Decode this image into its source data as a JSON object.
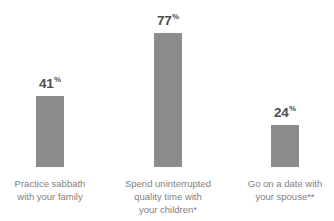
{
  "chart_data": {
    "type": "bar",
    "title": "",
    "subtitle": "",
    "xlabel": "",
    "ylabel": "",
    "ylim": [
      0,
      100
    ],
    "grid": false,
    "legend": "none",
    "unit": "%",
    "categories": [
      "Practice sabbath with your family",
      "Spend uninterrupted quality time with your children*",
      "Go on a date with your spouse**"
    ],
    "values": [
      41,
      77,
      24
    ],
    "value_labels": [
      "41",
      "77",
      "24"
    ],
    "percent_symbol": "%",
    "colors": {
      "bar": "#8c8c8c",
      "value_label": "#4d4d4d",
      "category_label": "#7f7f7f",
      "background": "#ffffff"
    },
    "bars": [
      {
        "value": 41,
        "value_label": "41",
        "percent_symbol": "%",
        "category_lines": [
          "Practice sabbath",
          "with your family"
        ]
      },
      {
        "value": 77,
        "value_label": "77",
        "percent_symbol": "%",
        "category_lines": [
          "Spend uninterrupted",
          "quality time with",
          "your children*"
        ]
      },
      {
        "value": 24,
        "value_label": "24",
        "percent_symbol": "%",
        "category_lines": [
          "Go on a date with",
          "your spouse**"
        ]
      }
    ]
  }
}
